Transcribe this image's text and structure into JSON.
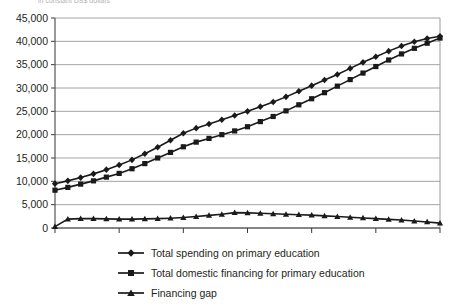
{
  "title_fragment": "in constant US$ dollars",
  "chart_data": {
    "type": "line",
    "title": "",
    "xlabel": "",
    "ylabel": "",
    "xlim": [
      2000,
      2030
    ],
    "ylim": [
      0,
      45000
    ],
    "ytick_values": [
      0,
      5000,
      10000,
      15000,
      20000,
      25000,
      30000,
      35000,
      40000,
      45000
    ],
    "ytick_labels": [
      "0",
      "5,000",
      "10,000",
      "15,000",
      "20,000",
      "25,000",
      "30,000",
      "35,000",
      "40,000",
      "45,000"
    ],
    "xtick_values": [
      2000,
      2005,
      2010,
      2015,
      2020,
      2025,
      2030
    ],
    "xtick_labels": [
      "2000",
      "2005",
      "2010",
      "2015",
      "2020",
      "2025",
      "2030"
    ],
    "grid": true,
    "legend_position": "below",
    "x": [
      2000,
      2001,
      2002,
      2003,
      2004,
      2005,
      2006,
      2007,
      2008,
      2009,
      2010,
      2011,
      2012,
      2013,
      2014,
      2015,
      2016,
      2017,
      2018,
      2019,
      2020,
      2021,
      2022,
      2023,
      2024,
      2025,
      2026,
      2027,
      2028,
      2029,
      2030
    ],
    "series": [
      {
        "name": "Total spending on primary education",
        "marker": "diamond",
        "color": "#1a1a1a",
        "values": [
          9500,
          10100,
          10800,
          11600,
          12500,
          13500,
          14600,
          15900,
          17300,
          18800,
          20300,
          21400,
          22300,
          23200,
          24100,
          25000,
          26000,
          27000,
          28100,
          29300,
          30500,
          31700,
          32900,
          34200,
          35500,
          36700,
          37900,
          39000,
          39900,
          40600,
          41100
        ]
      },
      {
        "name": "Total domestic financing for primary education",
        "marker": "square",
        "color": "#1a1a1a",
        "values": [
          8100,
          8700,
          9400,
          10100,
          10900,
          11700,
          12700,
          13800,
          15000,
          16200,
          17400,
          18400,
          19200,
          20000,
          20800,
          21700,
          22800,
          23900,
          25100,
          26400,
          27700,
          29000,
          30400,
          31800,
          33200,
          34600,
          36000,
          37300,
          38500,
          39600,
          40700
        ]
      },
      {
        "name": "Financing gap",
        "marker": "triangle",
        "color": "#1a1a1a",
        "values": [
          300,
          1900,
          2000,
          2000,
          1950,
          1900,
          1900,
          1950,
          2000,
          2100,
          2250,
          2450,
          2700,
          2950,
          3300,
          3250,
          3150,
          3050,
          2950,
          2850,
          2750,
          2600,
          2450,
          2300,
          2150,
          2000,
          1850,
          1700,
          1500,
          1300,
          1050
        ]
      }
    ]
  },
  "legend": {
    "items": [
      {
        "label": "Total spending on primary education",
        "marker": "diamond"
      },
      {
        "label": "Total domestic financing for primary education",
        "marker": "square"
      },
      {
        "label": "Financing gap",
        "marker": "triangle"
      }
    ]
  }
}
